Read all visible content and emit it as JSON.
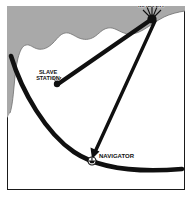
{
  "figure": {
    "background_color": "#ffffff",
    "land_color": "#a8a8a8",
    "water_color": "#ffffff",
    "line_color": "#101010",
    "border_color": "#1a1a1a"
  },
  "labels": {
    "master": "MASTER",
    "slave_line1": "SLAVE",
    "slave_line2": "STATION",
    "navigator": "NAVIGATOR"
  },
  "stations": {
    "master": {
      "name": "MASTER",
      "x": 152,
      "y": 18
    },
    "slave": {
      "name": "SLAVE STATION",
      "x": 56,
      "y": 84
    },
    "navigator": {
      "name": "NAVIGATOR",
      "x": 93,
      "y": 162
    }
  },
  "icons": {
    "master_tower": "antenna-tower-icon",
    "slave_tower": "antenna-tower-icon",
    "navigator_ship": "ship-icon",
    "arrow": "arrow-icon"
  },
  "baselines": [
    {
      "name": "master-to-slave-baseline",
      "from": "MASTER",
      "to": "SLAVE STATION"
    },
    {
      "name": "master-to-navigator-baseline",
      "from": "MASTER",
      "to": "NAVIGATOR"
    }
  ],
  "hyperbola": {
    "name": "line-of-position",
    "passes_through": "NAVIGATOR",
    "left_end": {
      "x": 11,
      "y": 56
    },
    "right_end": {
      "x": 182,
      "y": 169
    }
  }
}
